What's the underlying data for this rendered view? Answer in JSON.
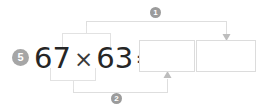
{
  "exercise": {
    "index_badge": "5",
    "equation": {
      "left_operand": "67",
      "operator": "×",
      "right_operand": "63",
      "equals": "="
    },
    "answer_boxes": [
      {
        "name": "tens-product-box",
        "value": ""
      },
      {
        "name": "ones-product-box",
        "value": ""
      }
    ],
    "steps": [
      {
        "label": "1",
        "name": "step-one-connector"
      },
      {
        "label": "2",
        "name": "step-two-connector"
      }
    ]
  },
  "colors": {
    "badge_fill": "#a6a6a6",
    "step_badge_fill": "#9b9b9b",
    "badge_text": "#ffffff",
    "digit_text": "#262626",
    "operator_text": "#3a3a3a",
    "box_border": "#dcdcdc",
    "connector_line": "#dedede",
    "bracket_line": "#e2e2e2",
    "arrow_fill": "#bdbdbd",
    "background": "#ffffff"
  }
}
